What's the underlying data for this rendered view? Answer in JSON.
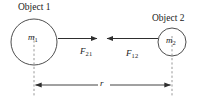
{
  "figure": {
    "background_color": "#ffffff",
    "stroke_color": "#3a3a3a",
    "dash_color": "#8c8c8c",
    "width": 201,
    "height": 102
  },
  "objects": [
    {
      "id": "object-1",
      "label": "Object 1",
      "mass_symbol": "m",
      "mass_subscript": "1",
      "center_x": 34,
      "center_y": 42,
      "radius": 23
    },
    {
      "id": "object-2",
      "label": "Object 2",
      "mass_symbol": "m",
      "mass_subscript": "2",
      "center_x": 172,
      "center_y": 42,
      "radius": 14
    }
  ],
  "forces": [
    {
      "id": "force-21",
      "symbol": "F",
      "subscript": "21",
      "direction": "right",
      "from_x": 58,
      "to_x": 98,
      "y": 38,
      "description": "Force on object 1 due to object 2, pointing toward object 2"
    },
    {
      "id": "force-12",
      "symbol": "F",
      "subscript": "12",
      "direction": "left",
      "from_x": 158,
      "to_x": 106,
      "y": 38,
      "description": "Force on object 2 due to object 1, pointing toward object 1"
    }
  ],
  "distance": {
    "id": "separation-r",
    "symbol": "r",
    "left_x": 34,
    "right_x": 172,
    "y": 85,
    "description": "Center-to-center separation between the two objects"
  },
  "center_lines": [
    {
      "id": "center-line-1",
      "x": 34,
      "y_top": 36,
      "y_bottom": 96
    },
    {
      "id": "center-line-2",
      "x": 172,
      "y_top": 36,
      "y_bottom": 96
    }
  ]
}
